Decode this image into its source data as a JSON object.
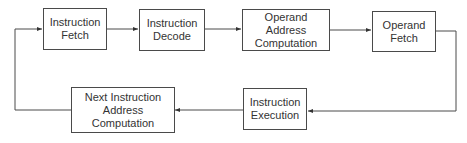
{
  "diagram": {
    "type": "flowchart",
    "nodes": [
      {
        "id": "fetch",
        "label": "Instruction\nFetch"
      },
      {
        "id": "decode",
        "label": "Instruction\nDecode"
      },
      {
        "id": "opaddr",
        "label": "Operand\nAddress\nComputation"
      },
      {
        "id": "opfetch",
        "label": "Operand\nFetch"
      },
      {
        "id": "exec",
        "label": "Instruction\nExecution"
      },
      {
        "id": "nextaddr",
        "label": "Next Instruction\nAddress\nComputation"
      }
    ],
    "edges": [
      {
        "from": "fetch",
        "to": "decode"
      },
      {
        "from": "decode",
        "to": "opaddr"
      },
      {
        "from": "opaddr",
        "to": "opfetch"
      },
      {
        "from": "opfetch",
        "to": "exec"
      },
      {
        "from": "exec",
        "to": "nextaddr"
      },
      {
        "from": "nextaddr",
        "to": "fetch"
      }
    ],
    "colors": {
      "line": "#4a4a4a",
      "text": "#333333",
      "background": "#ffffff"
    }
  }
}
